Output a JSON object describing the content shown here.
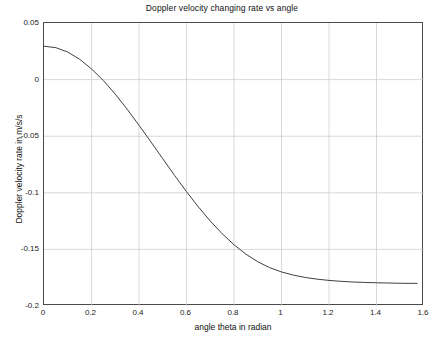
{
  "chart_data": {
    "type": "line",
    "title": "Doppler velocity changing rate vs angle",
    "xlabel": "angle theta in radian",
    "ylabel": "Doppler velocity rate in m/s/s",
    "xlim": [
      0,
      1.6
    ],
    "ylim": [
      -0.2,
      0.05
    ],
    "grid": true,
    "legend": null,
    "xticks": [
      "0",
      "0.2",
      "0.4",
      "0.6",
      "0.8",
      "1",
      "1.2",
      "1.4",
      "1.6"
    ],
    "xtick_values": [
      0,
      0.2,
      0.4,
      0.6,
      0.8,
      1.0,
      1.2,
      1.4,
      1.6
    ],
    "yticks": [
      "0.05",
      "0",
      "-0.05",
      "-0.1",
      "-0.15",
      "-0.2"
    ],
    "ytick_values": [
      0.05,
      0,
      -0.05,
      -0.1,
      -0.15,
      -0.2
    ],
    "line_color": "#404040",
    "line_width": 1,
    "series": [
      {
        "name": "Doppler velocity changing rate",
        "x": [
          0,
          0.05,
          0.1,
          0.15,
          0.2,
          0.25,
          0.3,
          0.35,
          0.4,
          0.45,
          0.5,
          0.55,
          0.6,
          0.65,
          0.7,
          0.75,
          0.8,
          0.85,
          0.9,
          0.95,
          1.0,
          1.05,
          1.1,
          1.15,
          1.2,
          1.25,
          1.3,
          1.35,
          1.4,
          1.45,
          1.5,
          1.55,
          1.5708
        ],
        "values": [
          0.0295,
          0.0282,
          0.0243,
          0.018,
          0.0095,
          -0.0008,
          -0.0128,
          -0.0261,
          -0.0403,
          -0.055,
          -0.0699,
          -0.0847,
          -0.099,
          -0.1125,
          -0.1249,
          -0.1361,
          -0.1459,
          -0.1542,
          -0.1609,
          -0.1661,
          -0.1699,
          -0.1727,
          -0.1748,
          -0.1763,
          -0.1774,
          -0.1782,
          -0.1788,
          -0.1792,
          -0.1795,
          -0.1797,
          -0.1799,
          -0.18,
          -0.18
        ]
      }
    ]
  }
}
